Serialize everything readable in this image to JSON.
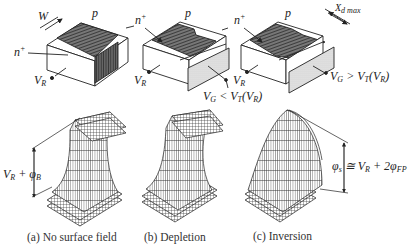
{
  "figure": {
    "devices": [
      {
        "id": "a",
        "labels": {
          "width": "W",
          "p_region": "p",
          "n_plus": "n",
          "n_plus_sup": "+",
          "terminal": "V",
          "terminal_sub": "R"
        }
      },
      {
        "id": "b",
        "labels": {
          "p_region": "p",
          "n_plus": "n",
          "n_plus_sup": "+",
          "terminal": "V",
          "terminal_sub": "R",
          "gate_condition": "V",
          "gate_condition_sub": "G",
          "gate_condition_rest": " < V",
          "gate_condition_rest_sub": "T",
          "gate_condition_tail": "(V",
          "gate_condition_tail_sub": "R",
          "gate_condition_end": ")"
        }
      },
      {
        "id": "c",
        "labels": {
          "depletion_width": "X",
          "depletion_width_sub": "d max",
          "p_region": "p",
          "n_plus": "n",
          "n_plus_sup": "+",
          "terminal": "V",
          "terminal_sub": "R",
          "gate_condition": "V",
          "gate_condition_sub": "G",
          "gate_condition_rest": " > V",
          "gate_condition_rest_sub": "T",
          "gate_condition_tail": "(V",
          "gate_condition_tail_sub": "R",
          "gate_condition_end": ")"
        }
      }
    ],
    "potential_plots": [
      {
        "id": "a",
        "annotation": "V",
        "annotation_sub": "R",
        "annotation_rest": " + φ",
        "annotation_rest_sub": "B",
        "caption": "(a)  No surface field"
      },
      {
        "id": "b",
        "caption": "(b)  Depletion"
      },
      {
        "id": "c",
        "annotation": "φ",
        "annotation_sub": "s",
        "annotation_rest": " ≅ V",
        "annotation_rest_sub": "R",
        "annotation_tail": " + 2φ",
        "annotation_tail_sub": "FP",
        "caption": "(c)  Inversion"
      }
    ],
    "colors": {
      "ink": "#222222",
      "hatch": "#555555",
      "gate_fill": "#d9d9d9",
      "background": "#ffffff"
    }
  }
}
